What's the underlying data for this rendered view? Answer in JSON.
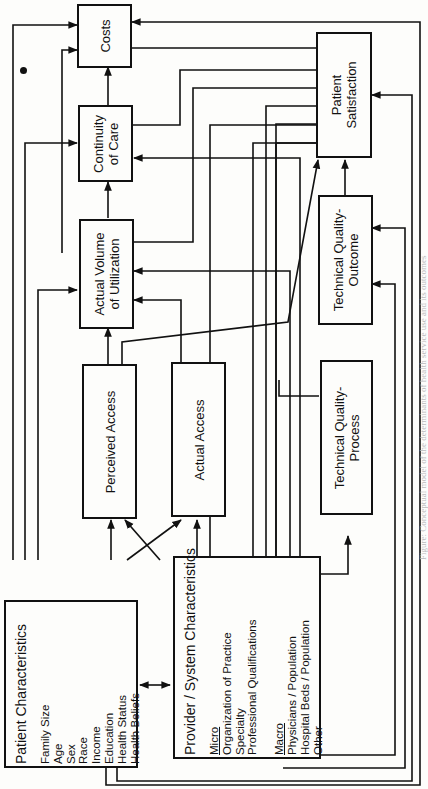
{
  "diagram": {
    "boxes": {
      "costs": {
        "label": "Costs"
      },
      "continuity": {
        "line1": "Continuity",
        "line2": "of Care"
      },
      "volume": {
        "line1": "Actual Volume",
        "line2": "of Utilization"
      },
      "perceived_access": {
        "label": "Perceived Access"
      },
      "actual_access": {
        "label": "Actual Access"
      },
      "satisfaction": {
        "line1": "Patient",
        "line2": "Satisfaction"
      },
      "tq_outcome": {
        "line1": "Technical Quality-",
        "line2": "Outcome"
      },
      "tq_process": {
        "line1": "Technical Quality-",
        "line2": "Process"
      }
    },
    "patient_characteristics": {
      "title": "Patient Characteristics",
      "items": [
        "Family Size",
        "Age",
        "Sex",
        "Race",
        "Income",
        "Education",
        "Health Status",
        "Health Beliefs"
      ]
    },
    "provider_characteristics": {
      "title": "Provider / System Characteristics",
      "micro_heading": "Micro",
      "micro_items": [
        "Organization of Practice",
        "Specialty",
        "Professional Qualifications"
      ],
      "macro_heading": "Macro",
      "macro_items": [
        "Physicians / Population",
        "Hospital Beds / Population",
        "Other"
      ]
    },
    "caption": "Figure: Conceptual model of the determinants of health service use and its outcomes"
  },
  "colors": {
    "ink": "#111111",
    "paper": "#fdfdfb"
  }
}
